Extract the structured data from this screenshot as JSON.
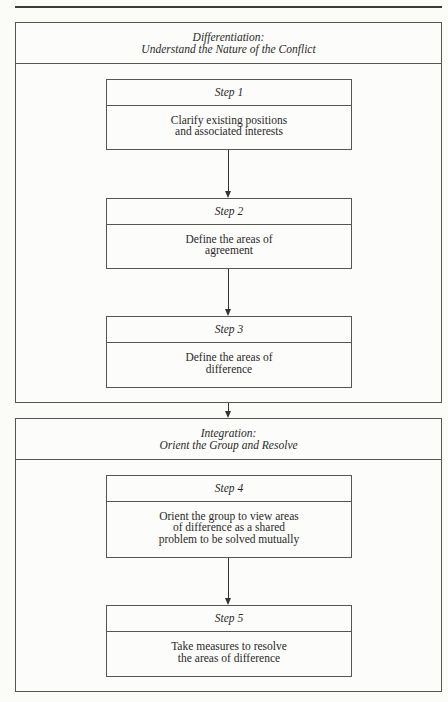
{
  "diagram": {
    "phases": [
      {
        "title": "Differentiation:",
        "subtitle": "Understand the Nature of the Conflict",
        "steps": [
          {
            "label": "Step 1",
            "lines": [
              "Clarify existing positions",
              "and associated interests"
            ]
          },
          {
            "label": "Step 2",
            "lines": [
              "Define the areas of",
              "agreement"
            ]
          },
          {
            "label": "Step 3",
            "lines": [
              "Define the areas of",
              "difference"
            ]
          }
        ]
      },
      {
        "title": "Integration:",
        "subtitle": "Orient the Group and Resolve",
        "steps": [
          {
            "label": "Step 4",
            "lines": [
              "Orient the group to view areas",
              "of difference as a shared",
              "problem to be solved mutually"
            ]
          },
          {
            "label": "Step 5",
            "lines": [
              "Take measures to resolve",
              "the areas of difference"
            ]
          }
        ]
      }
    ],
    "colors": {
      "line": "#555555",
      "background": "#fbfbf8",
      "text": "#2a2a2a"
    }
  }
}
